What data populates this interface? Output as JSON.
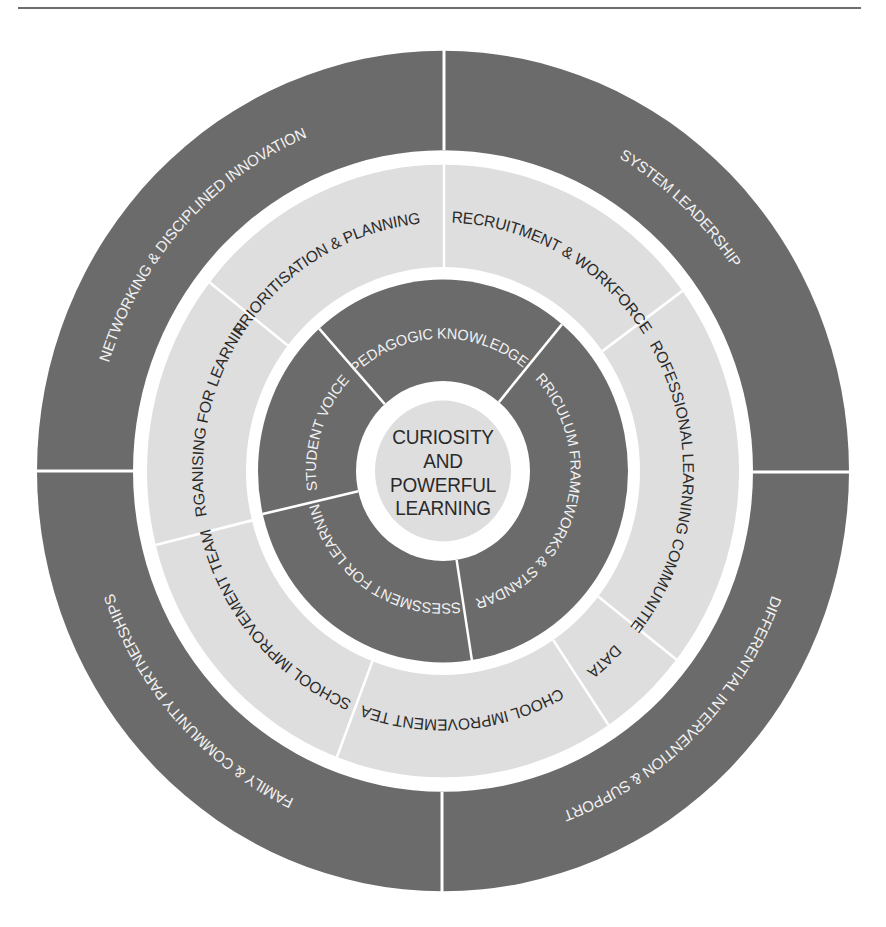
{
  "colors": {
    "dark": "#6b6b6b",
    "light": "#dedede",
    "white": "#ffffff",
    "dark_text": "#2a2a2a",
    "light_text": "#f2f2f2",
    "rule": "#6e6e6e"
  },
  "center": {
    "lines": [
      "CURIOSITY",
      "AND",
      "POWERFUL",
      "LEARNING"
    ]
  },
  "outer_ring": {
    "segments": [
      {
        "label": "NETWORKING & DISCIPLINED INNOVATION"
      },
      {
        "label": "SYSTEM LEADERSHIP"
      },
      {
        "label": "DIFFERENTIAL INTERVENTION & SUPPORT"
      },
      {
        "label": "FAMILY & COMMUNITY PARTNERSHIPS"
      }
    ]
  },
  "middle_ring": {
    "segments": [
      {
        "label": "PRIORITISATION & PLANNING"
      },
      {
        "label": "RECRUITMENT & WORKFORCE"
      },
      {
        "label": "PROFESSIONAL LEARNING COMMUNITIES"
      },
      {
        "label": "DATA"
      },
      {
        "label": "SCHOOL IMPROVEMENT TEAM"
      },
      {
        "label": "SCHOOL IMPROVEMENT TEAM"
      },
      {
        "label": "ORGANISING FOR LEARNING"
      }
    ]
  },
  "inner_ring": {
    "segments": [
      {
        "label": "PEDAGOGIC KNOWLEDGE"
      },
      {
        "label": "CURRICULUM FRAMEWORKS & STANDARDS"
      },
      {
        "label": "ASSESSMENT FOR LEARNING"
      },
      {
        "label": "STUDENT VOICE"
      }
    ]
  }
}
